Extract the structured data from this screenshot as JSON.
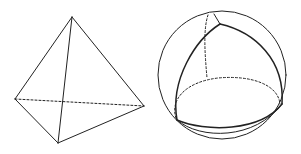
{
  "figures": [
    {
      "name": "tetrahedron",
      "description": "Euclidean tetrahedron with one hidden (dashed) edge",
      "vertices": {
        "top": [
          72,
          17
        ],
        "left": [
          15,
          99
        ],
        "front": [
          58,
          143
        ],
        "right": [
          144,
          106
        ]
      },
      "solid_edges": [
        [
          "top",
          "left"
        ],
        [
          "top",
          "front"
        ],
        [
          "top",
          "right"
        ],
        [
          "left",
          "front"
        ],
        [
          "front",
          "right"
        ]
      ],
      "dashed_edges": [
        [
          "left",
          "right"
        ]
      ]
    },
    {
      "name": "spherical-tetrahedron",
      "description": "Sphere containing a curved (spherical) tetrahedron with hidden dashed edges",
      "sphere": {
        "cx": 222,
        "cy": 75,
        "r": 64
      }
    }
  ],
  "colors": {
    "stroke": "#222222",
    "background": "#ffffff"
  }
}
